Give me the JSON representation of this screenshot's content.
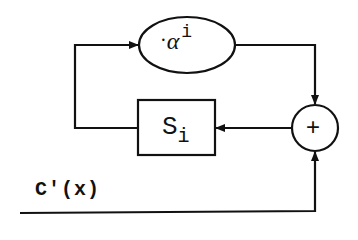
{
  "diagram": {
    "type": "block-diagram",
    "blocks": {
      "multiplier": {
        "shape": "ellipse",
        "label_dot": "·",
        "label_base": "α",
        "label_sup": "i"
      },
      "register": {
        "shape": "rectangle",
        "label_base": "S",
        "label_sub": "i"
      },
      "adder": {
        "shape": "circle",
        "label": "+"
      }
    },
    "input": {
      "label": "C'(x)"
    },
    "edges": [
      {
        "from": "multiplier",
        "to": "adder"
      },
      {
        "from": "adder",
        "to": "register"
      },
      {
        "from": "register",
        "to": "multiplier"
      },
      {
        "from": "input",
        "to": "adder"
      }
    ],
    "colors": {
      "stroke": "#111111",
      "background": "#ffffff"
    }
  }
}
